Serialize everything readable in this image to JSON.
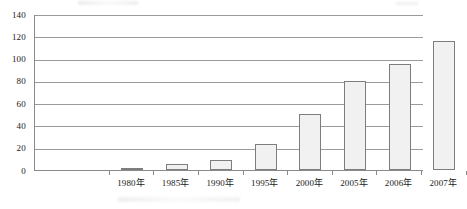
{
  "chart_data": {
    "type": "bar",
    "title": "",
    "subtitle": "",
    "xlabel": "",
    "ylabel": "",
    "categories": [
      "1980年",
      "1985年",
      "1990年",
      "1995年",
      "2000年",
      "2005年",
      "2006年",
      "2007年"
    ],
    "values": [
      2,
      5,
      9,
      23,
      50,
      80,
      95,
      116
    ],
    "series": [
      {
        "name": "",
        "values": [
          2,
          5,
          9,
          23,
          50,
          80,
          95,
          116
        ]
      }
    ],
    "ylim": [
      0,
      140
    ],
    "yticks": [
      0,
      20,
      40,
      60,
      80,
      100,
      120,
      140
    ],
    "ytick_labels": [
      "0",
      "20",
      "40",
      "60",
      "80",
      "100",
      "120",
      "140"
    ],
    "grid": "horizontal",
    "legend": "none",
    "colors": {
      "bar_fill": "#f1f1f1",
      "bar_border": "#7d7d7d",
      "gridline": "#9a9a9a",
      "axis": "#8a8a8a",
      "text": "#1a1a1a",
      "background": "#ffffff"
    }
  }
}
